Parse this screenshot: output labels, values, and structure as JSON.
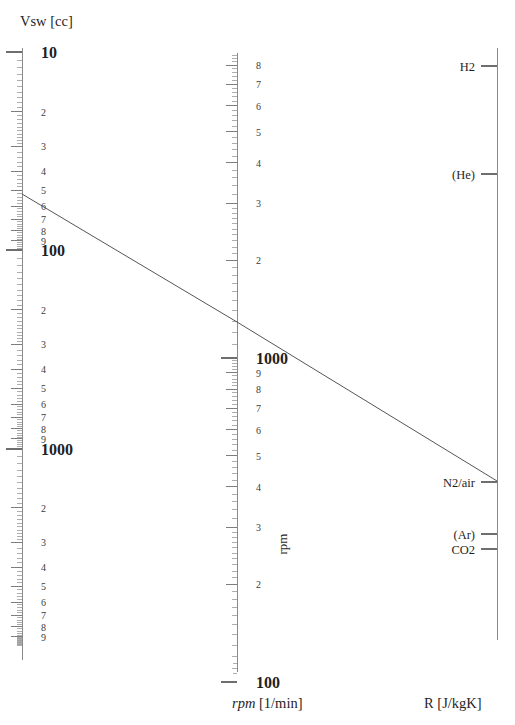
{
  "figure": {
    "kind": "nomogram",
    "background_color": "#ffffff",
    "line_color": "#555555",
    "axis_color": "#8a8a8a",
    "text_color": "#1f1f1f"
  },
  "titles": {
    "left_axis_title": "Vsw [cc]",
    "middle_axis_title_italic": "rpm",
    "middle_axis_title_rest": " [1/min]",
    "middle_axis_rotated_label": "rpm",
    "right_axis_title": "R [J/kgK]"
  },
  "chart_data": {
    "type": "line",
    "xlabel": "",
    "ylabel": "",
    "grid": false,
    "legend": "none",
    "axes": [
      {
        "name": "Vsw",
        "label": "Vsw [cc]",
        "units": "cc",
        "scale": "log",
        "orientation": "vertical",
        "direction": "increasing-downward",
        "x_px": 22,
        "range": [
          10,
          9000
        ],
        "decade_labels": [
          "10",
          "100",
          "1000"
        ],
        "decade_px": [
          52,
          250,
          449
        ],
        "minor_labels": [
          "2",
          "3",
          "4",
          "5",
          "6",
          "7",
          "8",
          "9"
        ],
        "tick_side": "left"
      },
      {
        "name": "rpm",
        "label": "rpm [1/min]",
        "units": "1/min",
        "scale": "log",
        "orientation": "vertical",
        "direction": "decreasing-downward",
        "x_px": 237,
        "range": [
          100,
          8000
        ],
        "decade_labels": [
          "1000",
          "100"
        ],
        "decade_px": [
          358,
          682
        ],
        "minor_labels_upper": [
          "2",
          "3",
          "4",
          "5",
          "6",
          "7",
          "8"
        ],
        "minor_labels_lower": [
          "9",
          "8",
          "7",
          "6",
          "5",
          "4",
          "3",
          "2"
        ],
        "tick_side": "left"
      },
      {
        "name": "R",
        "label": "R [J/kgK]",
        "units": "J/kgK",
        "scale": "log",
        "orientation": "vertical",
        "direction": "decreasing-downward",
        "x_px": 497,
        "tick_side": "left",
        "top_px": 48,
        "bottom_px": 640,
        "gas_points": [
          {
            "label": "H2",
            "y_px": 66,
            "R_value": 4124
          },
          {
            "label": "(He)",
            "y_px": 174,
            "R_value": 2077
          },
          {
            "label": "N2/air",
            "y_px": 482,
            "R_value": 287
          },
          {
            "label": "(Ar)",
            "y_px": 534,
            "R_value": 208
          },
          {
            "label": "CO2",
            "y_px": 549,
            "R_value": 189
          }
        ]
      }
    ],
    "index_line": {
      "description": "Straight alignment line connecting Vsw ≈ 50 cc, rpm ≈ 1450 1/min and R = 287 J/kgK (N2/air)",
      "points_px": [
        {
          "x": 22,
          "y": 194
        },
        {
          "x": 237,
          "y": 322
        },
        {
          "x": 497,
          "y": 481
        }
      ],
      "readings": [
        {
          "axis": "Vsw",
          "value": 50,
          "units": "cc"
        },
        {
          "axis": "rpm",
          "value": 1450,
          "units": "1/min"
        },
        {
          "axis": "R",
          "value": 287,
          "units": "J/kgK",
          "gas": "N2/air"
        }
      ]
    }
  }
}
